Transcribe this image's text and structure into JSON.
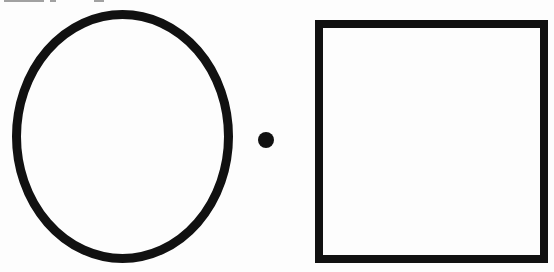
{
  "figure": {
    "background_color": "#ffffff",
    "stroke_color": "#111111",
    "shapes": [
      {
        "name": "ellipse",
        "type": "ellipse",
        "cx": 122.5,
        "cy": 136.5,
        "rx": 106,
        "ry": 122,
        "stroke_width": 9
      },
      {
        "name": "dot",
        "type": "circle",
        "cx": 266,
        "cy": 140,
        "r": 8
      },
      {
        "name": "square",
        "type": "rect",
        "x": 319,
        "y": 24,
        "width": 225,
        "height": 235,
        "stroke_width": 8
      }
    ]
  }
}
